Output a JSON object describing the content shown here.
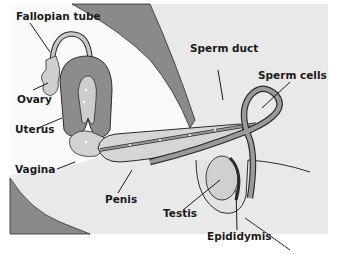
{
  "diagram": {
    "type": "anatomical-illustration",
    "colors": {
      "background_light": "#e9e9e9",
      "background_white": "#fafafa",
      "tissue_dark": "#8a8a8a",
      "tissue_mid": "#a8a8a8",
      "tissue_light": "#d2d2d2",
      "outline": "#2a2a2a"
    },
    "labels": [
      {
        "id": "fallopian-tube",
        "text": "Fallopian tube"
      },
      {
        "id": "ovary",
        "text": "Ovary"
      },
      {
        "id": "uterus",
        "text": "Uterus"
      },
      {
        "id": "vagina",
        "text": "Vagina"
      },
      {
        "id": "penis",
        "text": "Penis"
      },
      {
        "id": "sperm-duct",
        "text": "Sperm duct"
      },
      {
        "id": "sperm-cells",
        "text": "Sperm cells"
      },
      {
        "id": "testis",
        "text": "Testis"
      },
      {
        "id": "epididymis",
        "text": "Epididymis"
      }
    ]
  }
}
